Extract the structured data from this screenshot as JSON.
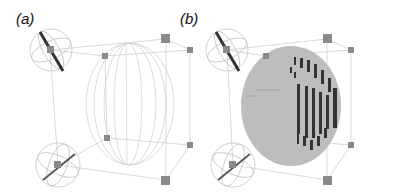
{
  "figure": {
    "panels": [
      {
        "label": "(a)",
        "content": "wireframe sphere inside manipulable bounding cube with rotation gizmos"
      },
      {
        "label": "(b)",
        "content": "voxelized sphere inside manipulable bounding cube with rotation gizmos"
      }
    ],
    "colors": {
      "edge": "#c8c8c8",
      "handle": "#888888",
      "gizmo_bar": "#333333",
      "voxel_fill": "#bdbdbd",
      "voxel_shadow": "#3a3a3a",
      "wire": "#cfcfcf"
    }
  }
}
